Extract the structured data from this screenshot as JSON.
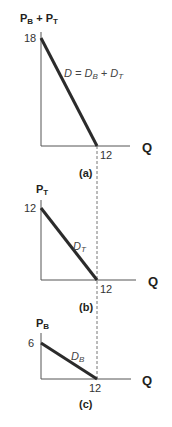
{
  "panels": [
    {
      "id": "a",
      "y_axis_label": "P",
      "y_axis_sub1": "B",
      "y_axis_plus": " + P",
      "y_axis_sub2": "T",
      "y_intercept": "18",
      "x_intercept": "12",
      "x_axis_label": "Q",
      "curve_label": "D = D",
      "curve_sub1": "B",
      "curve_plus": " + D",
      "curve_sub2": "T",
      "panel_label": "(a)"
    },
    {
      "id": "b",
      "y_axis_label": "P",
      "y_axis_sub": "T",
      "y_intercept": "12",
      "x_intercept": "12",
      "x_axis_label": "Q",
      "curve_label": "D",
      "curve_sub": "T",
      "panel_label": "(b)"
    },
    {
      "id": "c",
      "y_axis_label": "P",
      "y_axis_sub": "B",
      "y_intercept": "6",
      "x_intercept": "12",
      "x_axis_label": "Q",
      "curve_label": "D",
      "curve_sub": "B",
      "panel_label": "(c)"
    }
  ],
  "colors": {
    "curve": "#2b2b2b",
    "axis": "#555555",
    "dashed": "#777777"
  }
}
